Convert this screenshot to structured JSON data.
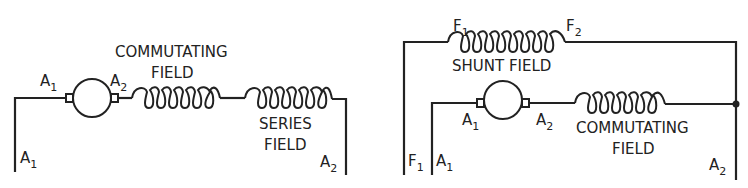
{
  "diagrams": [
    {
      "name": "series-motor",
      "labels": {
        "commutating_line1": "COMMUTATING",
        "commutating_line2": "FIELD",
        "series_line1": "SERIES",
        "series_line2": "FIELD",
        "armature_a1": {
          "main": "A",
          "sub": "1"
        },
        "armature_a2": {
          "main": "A",
          "sub": "2"
        },
        "terminal_a1": {
          "main": "A",
          "sub": "1"
        },
        "terminal_a2": {
          "main": "A",
          "sub": "2"
        }
      }
    },
    {
      "name": "compound-motor",
      "labels": {
        "shunt": "SHUNT FIELD",
        "f1_top": {
          "main": "F",
          "sub": "1"
        },
        "f2_top": {
          "main": "F",
          "sub": "2"
        },
        "armature_a1": {
          "main": "A",
          "sub": "1"
        },
        "armature_a2": {
          "main": "A",
          "sub": "2"
        },
        "commutating_line1": "COMMUTATING",
        "commutating_line2": "FIELD",
        "terminal_f1": {
          "main": "F",
          "sub": "1"
        },
        "terminal_a1": {
          "main": "A",
          "sub": "1"
        },
        "terminal_a2": {
          "main": "A",
          "sub": "2"
        }
      }
    }
  ],
  "colors": {
    "ink": "#222222",
    "background": "#ffffff"
  }
}
